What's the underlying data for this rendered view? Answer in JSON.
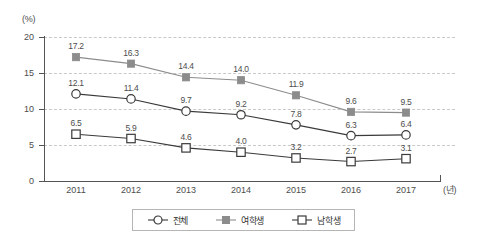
{
  "chart_data": {
    "type": "line",
    "title": "",
    "xlabel": "(년)",
    "ylabel": "(%)",
    "categories": [
      "2011",
      "2012",
      "2013",
      "2014",
      "2015",
      "2016",
      "2017"
    ],
    "ylim": [
      0,
      20
    ],
    "y_ticks": [
      "0",
      "5",
      "10",
      "15",
      "20"
    ],
    "grid": true,
    "legend_position": "bottom-center",
    "series": [
      {
        "name": "전체",
        "marker": "open-circle",
        "color": "#3a3a3a",
        "values": [
          12.1,
          11.4,
          9.7,
          9.2,
          7.8,
          6.3,
          6.4
        ],
        "labels": [
          "12.1",
          "11.4",
          "9.7",
          "9.2",
          "7.8",
          "6.3",
          "6.4"
        ]
      },
      {
        "name": "여학생",
        "marker": "filled-square",
        "color": "#8c8c8c",
        "values": [
          17.2,
          16.3,
          14.4,
          14.0,
          11.9,
          9.6,
          9.5
        ],
        "labels": [
          "17.2",
          "16.3",
          "14.4",
          "14.0",
          "11.9",
          "9.6",
          "9.5"
        ]
      },
      {
        "name": "남학생",
        "marker": "open-square",
        "color": "#3a3a3a",
        "values": [
          6.5,
          5.9,
          4.6,
          4.0,
          3.2,
          2.7,
          3.1
        ],
        "labels": [
          "6.5",
          "5.9",
          "4.6",
          "4.0",
          "3.2",
          "2.7",
          "3.1"
        ]
      }
    ]
  },
  "axes": {
    "y_unit": "(%)",
    "x_unit": "(년)"
  },
  "colors": {
    "axis": "#555555",
    "grid": "#c9c9c9",
    "series_dark": "#3a3a3a",
    "series_gray": "#8c8c8c",
    "text": "#4d4d4d",
    "legend_border": "#b5b5b5",
    "background": "#ffffff"
  }
}
